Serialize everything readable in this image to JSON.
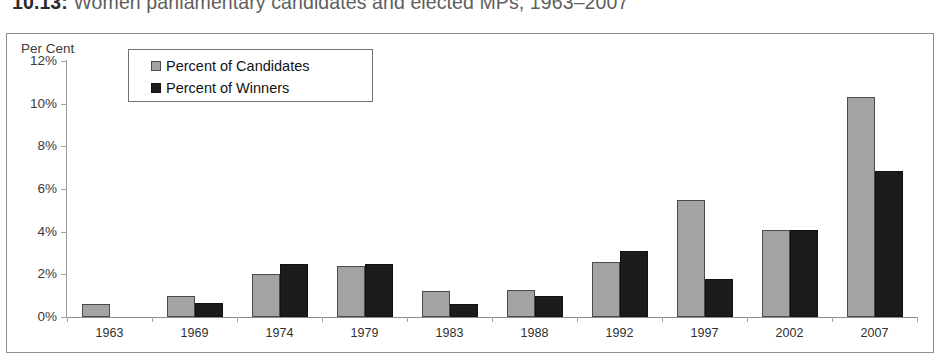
{
  "caption": {
    "number": "10.13:",
    "text": "Women parliamentary candidates and elected MPs, 1963–2007"
  },
  "chart_data": {
    "type": "bar",
    "title": "Women parliamentary candidates and elected MPs, 1963–2007",
    "xlabel": "",
    "ylabel": "Per Cent",
    "ylim": [
      0,
      12
    ],
    "ytick_labels": [
      "0%",
      "2%",
      "4%",
      "6%",
      "8%",
      "10%",
      "12%"
    ],
    "ytick_values": [
      0,
      2,
      4,
      6,
      8,
      10,
      12
    ],
    "grid": false,
    "legend_position": "upper-left-inside",
    "categories": [
      "1963",
      "1969",
      "1974",
      "1979",
      "1983",
      "1988",
      "1992",
      "1997",
      "2002",
      "2007"
    ],
    "series": [
      {
        "name": "Percent of Candidates",
        "color": "#a3a3a3",
        "values": [
          0.6,
          1.0,
          2.0,
          2.4,
          1.2,
          1.25,
          2.6,
          5.5,
          4.1,
          10.3
        ]
      },
      {
        "name": "Percent of Winners",
        "color": "#1c1c1c",
        "values": [
          0,
          0.65,
          2.5,
          2.5,
          0.6,
          1.0,
          3.1,
          1.8,
          4.1,
          6.85
        ]
      }
    ]
  }
}
